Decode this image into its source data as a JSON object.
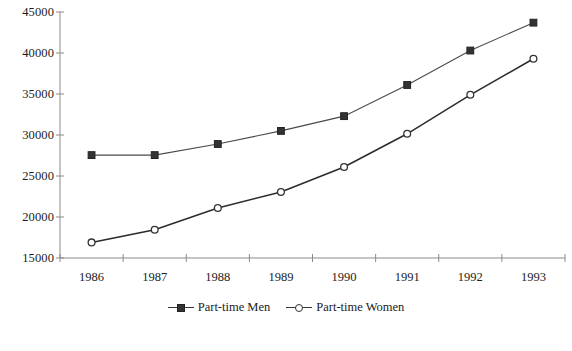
{
  "chart_data": {
    "type": "line",
    "title": "",
    "xlabel": "",
    "ylabel": "",
    "categories": [
      "1986",
      "1987",
      "1988",
      "1989",
      "1990",
      "1991",
      "1992",
      "1993"
    ],
    "ylim": [
      15000,
      45000
    ],
    "yticks": [
      "45000",
      "40000",
      "35000",
      "30000",
      "25000",
      "20000",
      "15000"
    ],
    "ytick_values": [
      45000,
      40000,
      35000,
      30000,
      25000,
      20000,
      15000
    ],
    "grid": false,
    "legend_position": "bottom-center",
    "series": [
      {
        "name": "Part-time Men",
        "marker": "filled-square",
        "color": "#333333",
        "values": [
          27550,
          27550,
          28900,
          30500,
          32300,
          36100,
          40300,
          43700
        ]
      },
      {
        "name": "Part-time Women",
        "marker": "open-circle",
        "color": "#2b2b2b",
        "values": [
          16900,
          18450,
          21100,
          23050,
          26100,
          30150,
          34900,
          39300
        ]
      }
    ]
  },
  "legend": {
    "items": [
      {
        "label": "Part-time Men",
        "marker": "square-marker-icon"
      },
      {
        "label": "Part-time Women",
        "marker": "circle-marker-icon"
      }
    ]
  },
  "colors": {
    "axis": "#8a8a8a",
    "men_line": "#4a4a4a",
    "women_line": "#2b2b2b",
    "text": "#1c1c1c",
    "background": "#ffffff"
  }
}
